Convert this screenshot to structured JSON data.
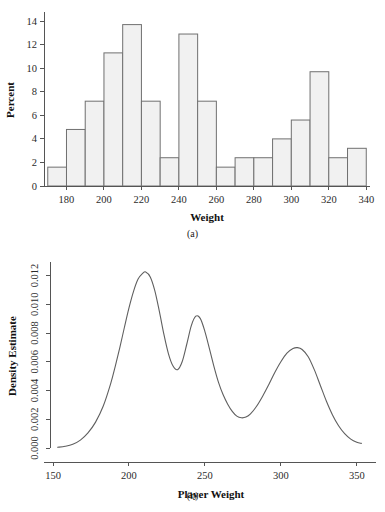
{
  "figure": {
    "panel_a_caption": "(a)",
    "panel_b_caption": "(b)"
  },
  "chart_data": [
    {
      "type": "bar",
      "panel": "(a)",
      "title": "",
      "xlabel": "Weight",
      "ylabel": "Percent",
      "xlim": [
        168,
        342
      ],
      "ylim": [
        0,
        14.6
      ],
      "grid": false,
      "legend": "none",
      "bin_width": 10,
      "bin_starts": [
        170,
        180,
        190,
        200,
        210,
        220,
        230,
        240,
        250,
        260,
        270,
        280,
        290,
        300,
        310,
        320,
        330
      ],
      "categories": [
        "170-180",
        "180-190",
        "190-200",
        "200-210",
        "210-220",
        "220-230",
        "230-240",
        "240-250",
        "250-260",
        "260-270",
        "270-280",
        "280-290",
        "290-300",
        "300-310",
        "310-320",
        "320-330",
        "330-340"
      ],
      "values": [
        1.6,
        4.8,
        7.2,
        11.3,
        13.7,
        7.2,
        2.4,
        12.9,
        7.2,
        1.6,
        2.4,
        2.4,
        4.0,
        5.6,
        9.7,
        2.4,
        3.2
      ],
      "xticks": [
        180,
        200,
        220,
        240,
        260,
        280,
        300,
        320,
        340
      ],
      "xticklabels": [
        "180",
        "200",
        "220",
        "240",
        "260",
        "280",
        "300",
        "320",
        "340"
      ],
      "yticks": [
        0,
        2,
        4,
        6,
        8,
        10,
        12,
        14
      ],
      "yticklabels": [
        "0",
        "2",
        "4",
        "6",
        "8",
        "10",
        "12",
        "14"
      ],
      "bar_fill": "#f1f1f1",
      "bar_stroke": "#707070"
    },
    {
      "type": "line",
      "panel": "(b)",
      "title": "",
      "xlabel": "Player Weight",
      "ylabel": "Density Estimate",
      "xlim": [
        148,
        360
      ],
      "ylim": [
        0.0,
        0.0128
      ],
      "grid": false,
      "legend": "none",
      "line_color": "#5f5f5f",
      "xticks": [
        150,
        200,
        250,
        300,
        350
      ],
      "xticklabels": [
        "150",
        "200",
        "250",
        "300",
        "350"
      ],
      "yticks": [
        0.0,
        0.002,
        0.004,
        0.006,
        0.008,
        0.01,
        0.012
      ],
      "yticklabels": [
        "0.000",
        "0.002",
        "0.004",
        "0.006",
        "0.008",
        "0.010",
        "0.012"
      ],
      "x": [
        153,
        158,
        163,
        168,
        173,
        178,
        183,
        188,
        191,
        194,
        197,
        200,
        203,
        206,
        209,
        211,
        214,
        217,
        220,
        223,
        226,
        229,
        232,
        235,
        238,
        241,
        244,
        247,
        250,
        253,
        256,
        259,
        262,
        265,
        268,
        271,
        274,
        277,
        280,
        284,
        288,
        292,
        296,
        300,
        304,
        308,
        311,
        314,
        318,
        322,
        326,
        330,
        334,
        338,
        342,
        346,
        350,
        353
      ],
      "y": [
        5e-05,
        0.00012,
        0.00026,
        0.00055,
        0.00105,
        0.0018,
        0.0029,
        0.0045,
        0.0057,
        0.007,
        0.0084,
        0.00975,
        0.0109,
        0.01175,
        0.01215,
        0.01225,
        0.0119,
        0.01095,
        0.0095,
        0.0079,
        0.00655,
        0.0057,
        0.00545,
        0.006,
        0.0072,
        0.0085,
        0.00917,
        0.009,
        0.0081,
        0.0069,
        0.00565,
        0.00455,
        0.0037,
        0.00305,
        0.00255,
        0.00222,
        0.0021,
        0.00215,
        0.00237,
        0.0029,
        0.0036,
        0.0044,
        0.00525,
        0.006,
        0.0066,
        0.00692,
        0.00698,
        0.00685,
        0.00635,
        0.00545,
        0.00435,
        0.00325,
        0.0023,
        0.00155,
        0.001,
        0.00062,
        0.0004,
        0.00032
      ]
    }
  ]
}
